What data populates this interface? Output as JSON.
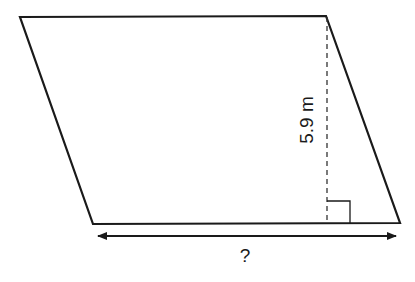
{
  "figure": {
    "shape": "parallelogram",
    "height_label": "5.9 m",
    "base_label": "?",
    "colors": {
      "stroke": "#1a1a1a",
      "background": "#ffffff"
    }
  }
}
